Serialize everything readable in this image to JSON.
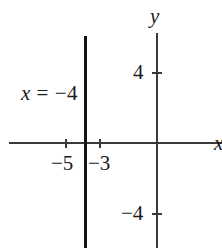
{
  "figure": {
    "background_color": "#ffffff",
    "axis_color": "#3a3a3a",
    "line_color": "#141414",
    "text_color": "#1b1b1b",
    "width": 222,
    "height": 248
  },
  "axis_labels": {
    "y": "y",
    "x": "x"
  },
  "annotation": {
    "equation_var": "x",
    "equation_rest": " = −4",
    "equation_full": "x = −4"
  },
  "ticks": {
    "x_axis": [
      {
        "label": "−5",
        "value": -5
      },
      {
        "label": "−3",
        "value": -3
      }
    ],
    "y_axis": [
      {
        "label": "4",
        "value": 4
      },
      {
        "label": "−4",
        "value": -4
      }
    ]
  },
  "chart_data": {
    "type": "line",
    "title": "",
    "subtitle": "",
    "xlabel": "x",
    "ylabel": "y",
    "grid": false,
    "legend": false,
    "annotations": [
      {
        "text": "x = −4",
        "x": -5.6,
        "y": 2.4,
        "describes": "vertical line"
      }
    ],
    "xlim": [
      -8.4,
      3.7
    ],
    "ylim": [
      -6.2,
      6.2
    ],
    "x_ticks": [
      -5,
      -3
    ],
    "x_tick_labels": [
      "−5",
      "−3"
    ],
    "y_ticks": [
      4,
      -4
    ],
    "y_tick_labels": [
      "4",
      "−4"
    ],
    "series": [
      {
        "name": "x = −4",
        "type": "vertical-line",
        "x_value": -4,
        "x": [
          -4,
          -4
        ],
        "y": [
          6.2,
          -6.2
        ],
        "style": "solid-thick",
        "color": "#141414"
      }
    ]
  }
}
